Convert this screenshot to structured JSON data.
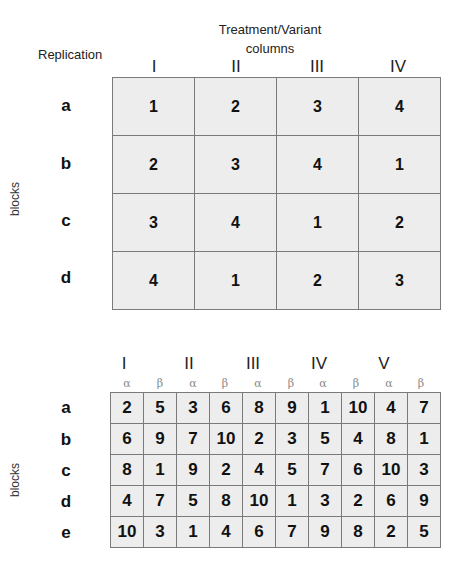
{
  "top": {
    "title_line1": "Treatment/Variant",
    "title_line2": "columns",
    "replication_label": "Replication",
    "side_label": "blocks",
    "columns": [
      "I",
      "II",
      "III",
      "IV"
    ],
    "rows": [
      {
        "label": "a",
        "cells": [
          "1",
          "2",
          "3",
          "4"
        ]
      },
      {
        "label": "b",
        "cells": [
          "2",
          "3",
          "4",
          "1"
        ]
      },
      {
        "label": "c",
        "cells": [
          "3",
          "4",
          "1",
          "2"
        ]
      },
      {
        "label": "d",
        "cells": [
          "4",
          "1",
          "2",
          "3"
        ]
      }
    ]
  },
  "bottom": {
    "side_label": "blocks",
    "columns": [
      "I",
      "II",
      "III",
      "IV",
      "V"
    ],
    "subcolumns": [
      "α",
      "β",
      "α",
      "β",
      "α",
      "β",
      "α",
      "β",
      "α",
      "β"
    ],
    "rows": [
      {
        "label": "a",
        "cells": [
          "2",
          "5",
          "3",
          "6",
          "8",
          "9",
          "1",
          "10",
          "4",
          "7"
        ]
      },
      {
        "label": "b",
        "cells": [
          "6",
          "9",
          "7",
          "10",
          "2",
          "3",
          "5",
          "4",
          "8",
          "1"
        ]
      },
      {
        "label": "c",
        "cells": [
          "8",
          "1",
          "9",
          "2",
          "4",
          "5",
          "7",
          "6",
          "10",
          "3"
        ]
      },
      {
        "label": "d",
        "cells": [
          "4",
          "7",
          "5",
          "8",
          "10",
          "1",
          "3",
          "2",
          "6",
          "9"
        ]
      },
      {
        "label": "e",
        "cells": [
          "10",
          "3",
          "1",
          "4",
          "6",
          "7",
          "9",
          "8",
          "2",
          "5"
        ]
      }
    ]
  }
}
